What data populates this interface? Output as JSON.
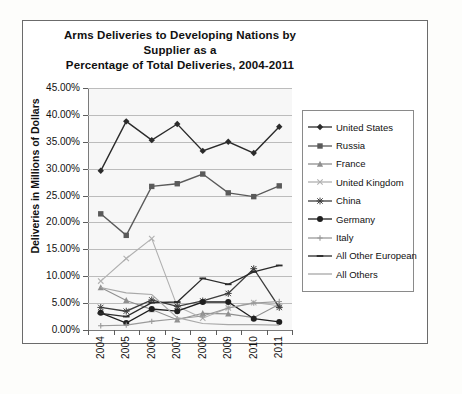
{
  "chart_data": {
    "type": "line",
    "title": "Arms Deliveries to Developing Nations by Supplier as a Percentage of Total Deliveries, 2004-2011",
    "title_line1": "Arms Deliveries to Developing Nations by Supplier as a",
    "title_line2": "Percentage of Total Deliveries, 2004-2011",
    "xlabel": "",
    "ylabel": "Deliveries in Millions of Dollars",
    "categories": [
      "2004",
      "2005",
      "2006",
      "2007",
      "2008",
      "2009",
      "2010",
      "2011"
    ],
    "ylim": [
      0,
      45
    ],
    "ytick_labels": [
      "45.00%",
      "40.00%",
      "35.00%",
      "30.00%",
      "25.00%",
      "20.00%",
      "15.00%",
      "10.00%",
      "5.00%",
      "0.00%"
    ],
    "ytick_values": [
      45,
      40,
      35,
      30,
      25,
      20,
      15,
      10,
      5,
      0
    ],
    "grid": true,
    "legend_position": "right",
    "series": [
      {
        "name": "United States",
        "marker": "diamond",
        "color": "#2b2b2b",
        "values": [
          29.6,
          38.8,
          35.3,
          38.3,
          33.3,
          35.0,
          32.9,
          37.8
        ]
      },
      {
        "name": "Russia",
        "marker": "square",
        "color": "#5a5a5a",
        "values": [
          21.6,
          17.6,
          26.7,
          27.2,
          29.0,
          25.5,
          24.8,
          26.8
        ]
      },
      {
        "name": "France",
        "marker": "triangle",
        "color": "#8f8f8f",
        "values": [
          7.9,
          5.5,
          3.8,
          1.9,
          3.1,
          3.0,
          2.3,
          4.8
        ]
      },
      {
        "name": "United Kingdom",
        "marker": "x",
        "color": "#b0b0b0",
        "values": [
          9.1,
          13.3,
          17.0,
          4.4,
          2.2,
          4.1,
          5.1,
          4.5
        ]
      },
      {
        "name": "China",
        "marker": "asterisk",
        "color": "#3d3d3d",
        "values": [
          4.2,
          3.5,
          5.6,
          4.4,
          5.4,
          6.8,
          11.4,
          4.2
        ]
      },
      {
        "name": "Germany",
        "marker": "circle",
        "color": "#1f1f1f",
        "values": [
          3.2,
          1.3,
          3.9,
          3.5,
          5.2,
          5.2,
          2.1,
          1.5
        ]
      },
      {
        "name": "Italy",
        "marker": "plus",
        "color": "#9a9a9a",
        "values": [
          0.8,
          0.9,
          1.6,
          2.1,
          2.6,
          4.1,
          5.0,
          5.3
        ]
      },
      {
        "name": "All Other European",
        "marker": "dash",
        "color": "#2b2b2b",
        "values": [
          3.1,
          2.5,
          5.1,
          5.2,
          9.6,
          8.5,
          10.8,
          12.0
        ]
      },
      {
        "name": "All Others",
        "marker": "line",
        "color": "#a8a8a8",
        "values": [
          7.9,
          6.9,
          6.6,
          2.3,
          1.2,
          1.0,
          1.0,
          0.9
        ]
      }
    ]
  }
}
